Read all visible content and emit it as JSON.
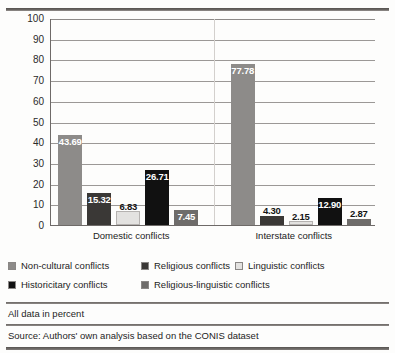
{
  "chart_data": {
    "type": "bar",
    "title": "",
    "xlabel": "",
    "ylabel": "",
    "ylim": [
      0,
      100
    ],
    "ytick_step": 10,
    "yticks": [
      "100",
      "90",
      "80",
      "70",
      "60",
      "50",
      "40",
      "30",
      "20",
      "10",
      "0"
    ],
    "grid": true,
    "legend_position": "below-plot",
    "categories": [
      "Domestic conflicts",
      "Interstate conflicts"
    ],
    "series": [
      {
        "name": "Non-cultural conflicts",
        "color": "#8d8b89",
        "values": [
          43.69,
          77.78
        ],
        "labels": [
          "43.69",
          "77.78"
        ]
      },
      {
        "name": "Religious conflicts",
        "color": "#3a3836",
        "values": [
          15.32,
          4.3
        ],
        "labels": [
          "15.32",
          "4.30"
        ]
      },
      {
        "name": "Linguistic conflicts",
        "color": "#e3e2e0",
        "values": [
          6.83,
          2.15
        ],
        "labels": [
          "6.83",
          "2.15"
        ]
      },
      {
        "name": "Historicitary conflicts",
        "color": "#111111",
        "values": [
          26.71,
          12.9
        ],
        "labels": [
          "26.71",
          "12.90"
        ]
      },
      {
        "name": "Religious-linguistic conflicts",
        "color": "#6e6c6a",
        "values": [
          7.45,
          2.87
        ],
        "labels": [
          "7.45",
          "2.87"
        ]
      }
    ]
  },
  "legend": {
    "rows": [
      [
        {
          "label": "Non-cultural conflicts",
          "color": "#8d8b89",
          "left": 0
        },
        {
          "label": "Religious conflicts",
          "color": "#3a3836",
          "left": 133
        },
        {
          "label": "Linguistic conflicts",
          "color": "#e3e2e0",
          "left": 227
        }
      ],
      [
        {
          "label": "Historicitary conflicts",
          "color": "#111111",
          "left": 0
        },
        {
          "label": "Religious-linguistic conflicts",
          "color": "#6e6c6a",
          "left": 133
        }
      ]
    ]
  },
  "footer": {
    "note": "All data in percent",
    "source": "Source: Authors' own analysis based on the CONIS dataset"
  }
}
